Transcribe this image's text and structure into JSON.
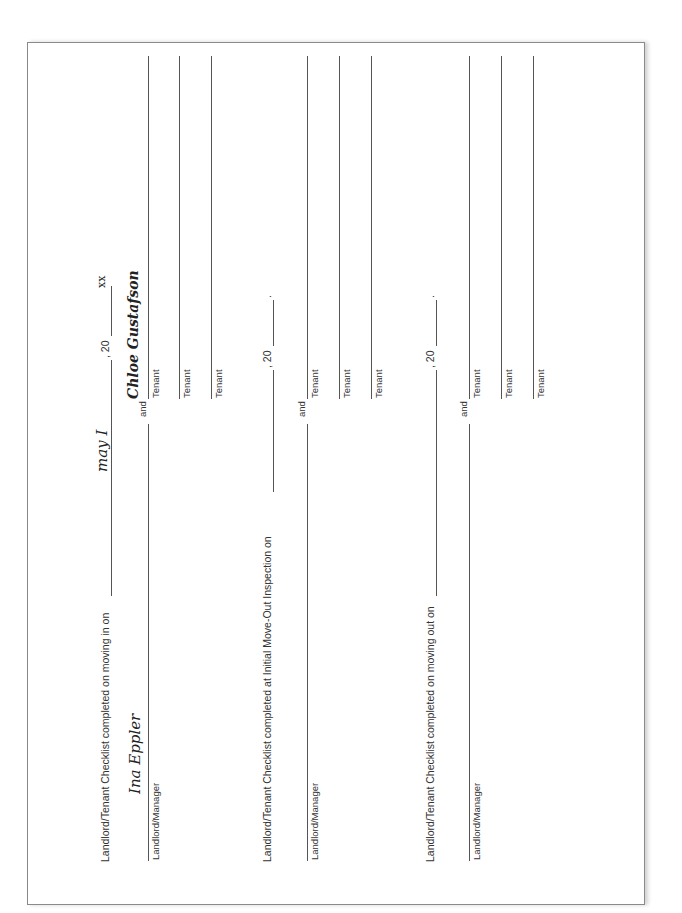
{
  "sections": [
    {
      "heading": "Landlord/Tenant Checklist completed on moving in on",
      "date_value": "may I",
      "year_prefix": ", 20",
      "year_value": "xx",
      "landlord_label": "Landlord/Manager",
      "landlord_signature": "Ina Eppler",
      "and_label": "and",
      "tenant_signature": "Chloe Gustafson",
      "tenant_labels": [
        "Tenant",
        "Tenant",
        "Tenant"
      ]
    },
    {
      "heading": "Landlord/Tenant Checklist completed at Initial Move-Out Inspection on",
      "date_value": "",
      "year_prefix": ", 20",
      "year_value": "",
      "year_suffix": ".",
      "landlord_label": "Landlord/Manager",
      "landlord_signature": "",
      "and_label": "and",
      "tenant_signature": "",
      "tenant_labels": [
        "Tenant",
        "Tenant",
        "Tenant"
      ]
    },
    {
      "heading": "Landlord/Tenant Checklist completed on moving out on",
      "date_value": "",
      "year_prefix": ", 20",
      "year_value": "",
      "year_suffix": ".",
      "landlord_label": "Landlord/Manager",
      "landlord_signature": "",
      "and_label": "and",
      "tenant_signature": "",
      "tenant_labels": [
        "Tenant",
        "Tenant",
        "Tenant"
      ]
    }
  ]
}
